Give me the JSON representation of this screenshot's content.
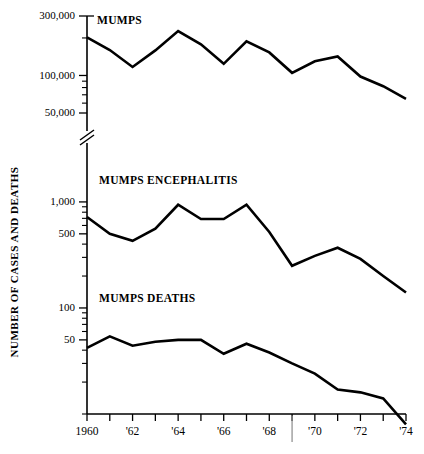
{
  "chart_data": {
    "type": "line",
    "title": "",
    "subtitle": "",
    "xlabel": "",
    "ylabel": "NUMBER OF CASES AND DEATHS",
    "y_scale": "log",
    "y_axis_broken": true,
    "y_break_note": "axis break between the cases decade band and the encephalitis/deaths band",
    "grid": false,
    "legend_position": "inline-labels",
    "x": [
      1960,
      1961,
      1962,
      1963,
      1964,
      1965,
      1966,
      1967,
      1968,
      1969,
      1970,
      1971,
      1972,
      1973,
      1974
    ],
    "x_tick_labels": [
      "1960",
      "",
      "'62",
      "",
      "'64",
      "",
      "'66",
      "",
      "'68",
      "",
      "'70",
      "",
      "'72",
      "",
      "'74"
    ],
    "x_major_labels": [
      "1960",
      "'62",
      "'64",
      "'66",
      "'68",
      "'70",
      "'72",
      "'74"
    ],
    "upper_y_ticks": [
      {
        "value": 300000,
        "label": "300,000",
        "major": true
      },
      {
        "value": 200000,
        "label": "",
        "major": false
      },
      {
        "value": 100000,
        "label": "100,000",
        "major": true
      },
      {
        "value": 90000,
        "label": "",
        "major": false
      },
      {
        "value": 80000,
        "label": "",
        "major": false
      },
      {
        "value": 70000,
        "label": "",
        "major": false
      },
      {
        "value": 60000,
        "label": "",
        "major": false
      },
      {
        "value": 50000,
        "label": "50,000",
        "major": true
      }
    ],
    "lower_y_ticks": [
      {
        "value": 1000,
        "label": "1,000",
        "major": true
      },
      {
        "value": 900,
        "label": "",
        "major": false
      },
      {
        "value": 800,
        "label": "",
        "major": false
      },
      {
        "value": 700,
        "label": "",
        "major": false
      },
      {
        "value": 600,
        "label": "",
        "major": false
      },
      {
        "value": 500,
        "label": "500",
        "major": true
      },
      {
        "value": 400,
        "label": "",
        "major": false
      },
      {
        "value": 300,
        "label": "",
        "major": false
      },
      {
        "value": 200,
        "label": "",
        "major": false
      },
      {
        "value": 100,
        "label": "100",
        "major": true
      },
      {
        "value": 90,
        "label": "",
        "major": false
      },
      {
        "value": 80,
        "label": "",
        "major": false
      },
      {
        "value": 70,
        "label": "",
        "major": false
      },
      {
        "value": 60,
        "label": "",
        "major": false
      },
      {
        "value": 50,
        "label": "50",
        "major": true
      },
      {
        "value": 40,
        "label": "",
        "major": false
      },
      {
        "value": 30,
        "label": "",
        "major": false
      },
      {
        "value": 20,
        "label": "",
        "major": false
      },
      {
        "value": 10,
        "label": "",
        "major": false
      }
    ],
    "series": [
      {
        "name": "MUMPS",
        "label": "MUMPS",
        "unit": "cases",
        "values": [
          202000,
          160000,
          117000,
          159000,
          227000,
          178000,
          124000,
          188000,
          153000,
          105000,
          130000,
          142000,
          98000,
          82000,
          65000
        ]
      },
      {
        "name": "MUMPS ENCEPHALITIS",
        "label": "MUMPS ENCEPHALITIS",
        "unit": "cases",
        "values": [
          720,
          500,
          430,
          560,
          940,
          690,
          690,
          940,
          520,
          250,
          310,
          370,
          290,
          200,
          140
        ]
      },
      {
        "name": "MUMPS DEATHS",
        "label": "MUMPS DEATHS",
        "unit": "deaths",
        "values": [
          42,
          54,
          44,
          48,
          50,
          50,
          37,
          46,
          38,
          30,
          24,
          17,
          16,
          14,
          8
        ]
      }
    ],
    "annotations": [
      {
        "kind": "axis-break",
        "axis": "y",
        "text": ""
      },
      {
        "kind": "vertical-divider",
        "axis": "x",
        "at": 1969,
        "text": ""
      }
    ]
  },
  "colors": {
    "line": "#000000",
    "axis": "#000000",
    "background": "#ffffff",
    "divider": "#8a8a8a"
  }
}
